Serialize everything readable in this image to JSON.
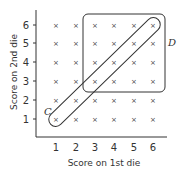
{
  "chart_data": {
    "type": "scatter",
    "title": "",
    "xlabel": "Score on 1st die",
    "ylabel": "Score on 2nd die",
    "x_ticks": [
      "1",
      "2",
      "3",
      "4",
      "5",
      "6"
    ],
    "y_ticks": [
      "1",
      "2",
      "3",
      "4",
      "5",
      "6"
    ],
    "point_marker": "×",
    "points": "all 36 pairs (x,y) for x in 1..6, y in 1..6",
    "regions": [
      {
        "label": "C",
        "shape": "diagonal band",
        "covers": [
          [
            1,
            1
          ],
          [
            2,
            2
          ],
          [
            3,
            3
          ],
          [
            4,
            4
          ],
          [
            5,
            5
          ],
          [
            6,
            6
          ]
        ]
      },
      {
        "label": "D",
        "shape": "rounded rectangle",
        "covers": "x in 3..6, y in 3..6"
      }
    ],
    "grid": false
  },
  "labels": {
    "xlabel": "Score on 1st die",
    "ylabel": "Score on 2nd die",
    "region_c": "C",
    "region_d": "D",
    "marker": "×"
  },
  "ticks": {
    "x": [
      "1",
      "2",
      "3",
      "4",
      "5",
      "6"
    ],
    "y": [
      "6",
      "5",
      "4",
      "3",
      "2",
      "1"
    ]
  }
}
